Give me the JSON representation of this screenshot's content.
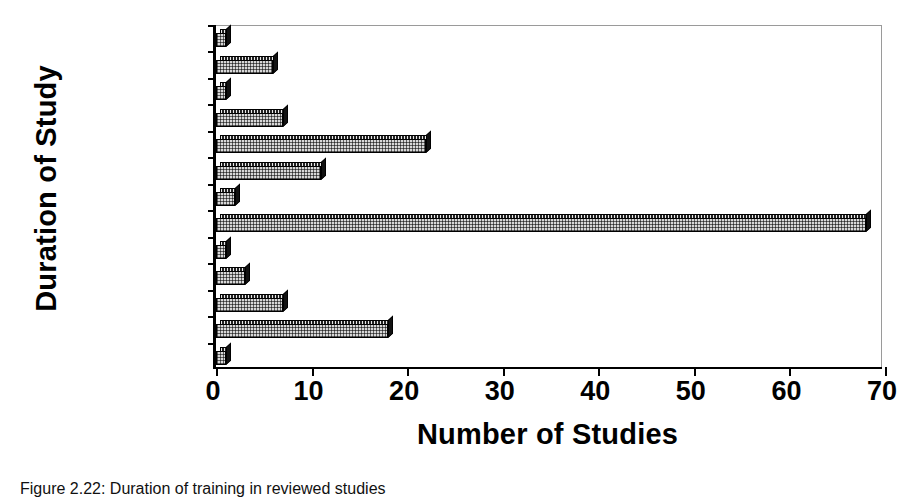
{
  "chart_data": {
    "type": "bar",
    "orientation": "horizontal",
    "title": "",
    "xlabel": "Number of Studies",
    "ylabel": "Duration of Study",
    "xlim": [
      0,
      70
    ],
    "xticks": [
      0,
      10,
      20,
      30,
      40,
      50,
      60,
      70
    ],
    "grid": false,
    "legend": "none",
    "categories": [
      "10 minutes",
      "15 minutes",
      "20 minutes",
      "30 minutes",
      "1 hour",
      "2 hours",
      "3 hours",
      "4 hours",
      "5 hours",
      "6 hours",
      "7 hours",
      "8 hours",
      "9 hours"
    ],
    "visible_tick_labels": [
      "10 minutes",
      "20 minutes",
      "1 hour",
      "3 hours",
      "5 hours",
      "7 hours",
      "9 hours"
    ],
    "values": [
      1,
      6,
      1,
      7,
      22,
      11,
      2,
      68,
      1,
      3,
      7,
      18,
      1
    ]
  },
  "caption": {
    "text": "Figure 2.22: Duration of training in reviewed studies"
  }
}
